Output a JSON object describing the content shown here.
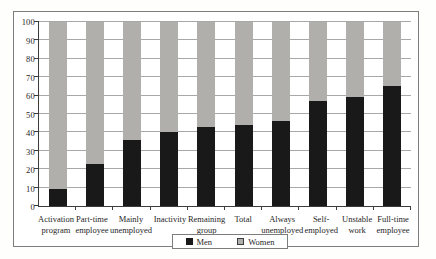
{
  "chart_data": {
    "type": "bar",
    "stacked": true,
    "title": "",
    "xlabel": "",
    "ylabel": "",
    "ylim": [
      0,
      100
    ],
    "ytick_step": 10,
    "grid": true,
    "legend_position": "bottom-center",
    "categories": [
      "Activation program",
      "Part-time employee",
      "Mainly unemployed",
      "Inactivity",
      "Remaining group",
      "Total",
      "Always unemployed",
      "Self-employed",
      "Unstable work",
      "Full-time employee"
    ],
    "category_label_lines": [
      [
        "Activation",
        "program"
      ],
      [
        "Part-time",
        "employee"
      ],
      [
        "Mainly",
        "unemployed"
      ],
      [
        "Inactivity"
      ],
      [
        "Remaining",
        "group"
      ],
      [
        "Total"
      ],
      [
        "Always",
        "unemployed"
      ],
      [
        "Self-",
        "employed"
      ],
      [
        "Unstable",
        "work"
      ],
      [
        "Full-time",
        "employee"
      ]
    ],
    "series": [
      {
        "name": "Men",
        "color": "#191919",
        "values": [
          9,
          23,
          36,
          40,
          43,
          44,
          46,
          57,
          59,
          65
        ]
      },
      {
        "name": "Women",
        "color": "#b0afac",
        "values": [
          91,
          77,
          64,
          60,
          57,
          56,
          54,
          43,
          41,
          35
        ]
      }
    ]
  }
}
